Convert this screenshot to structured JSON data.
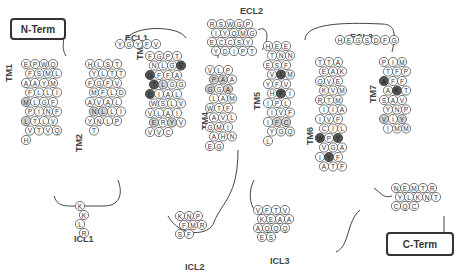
{
  "diagram": {
    "type": "GPCR snake plot",
    "terminals": {
      "n_term": "N-Term",
      "c_term": "C-Term"
    },
    "loops": {
      "ecl1": "ECL1",
      "ecl2": "ECL2",
      "ecl3": "ECL3",
      "icl1": "ICL1",
      "icl2": "ICL2",
      "icl3": "ICL3"
    },
    "helices": {
      "tm1": "TM1",
      "tm2": "TM2",
      "tm3": "TM3",
      "tm4": "TM4",
      "tm5": "TM5",
      "tm6": "TM6",
      "tm7": "TM7"
    },
    "colors": {
      "highlight_dark": "#555555",
      "shaded": "#cfcfcf",
      "outline": "#555555"
    },
    "segments": {
      "tm1": [
        "E",
        "P",
        "W",
        "Q",
        "F",
        "S",
        "M",
        "L",
        "A",
        "A",
        "Y",
        "M",
        "F",
        "L",
        "L",
        "I",
        "M",
        "L",
        "G",
        "F",
        "P",
        "I",
        "N",
        "F",
        "L",
        "T",
        "L",
        "V",
        "V",
        "T",
        "V",
        "Q",
        "H"
      ],
      "icl1": [
        "K",
        "K",
        "L",
        "R"
      ],
      "tm2": [
        "H",
        "L",
        "S",
        "T",
        "Y",
        "L",
        "T",
        "T",
        "F",
        "G",
        "F",
        "V",
        "M",
        "F",
        "L",
        "D",
        "A",
        "V",
        "A",
        "L",
        "N",
        "L",
        "L",
        "I",
        "Y",
        "N",
        "L",
        "P",
        "T"
      ],
      "ecl1": [
        "Y",
        "G",
        "Y",
        "F",
        "V"
      ],
      "tm3": [
        "F",
        "G",
        "P",
        "T",
        "N",
        "L",
        "G",
        "E",
        "G",
        "F",
        "F",
        "A",
        "T",
        "L",
        "G",
        "G",
        "E",
        "I",
        "A",
        "L",
        "W",
        "S",
        "L",
        "V",
        "V",
        "L",
        "A",
        "I",
        "E",
        "R",
        "Y",
        "V",
        "V",
        "V",
        "C"
      ],
      "icl2": [
        "K",
        "N",
        "P",
        "F",
        "M",
        "R",
        "S",
        "F"
      ],
      "tm4": [
        "V",
        "L",
        "P",
        "P",
        "A",
        "A",
        "G",
        "G",
        "A",
        "L",
        "A",
        "M",
        "W",
        "T",
        "F",
        "A",
        "V",
        "L",
        "G",
        "M",
        "I",
        "A",
        "H",
        "N",
        "E",
        "G"
      ],
      "ecl2": [
        "R",
        "S",
        "W",
        "G",
        "P",
        "I",
        "Y",
        "Q",
        "M",
        "G",
        "E",
        "C",
        "C",
        "S",
        "Y",
        "Y",
        "D",
        "I",
        "P",
        "T"
      ],
      "tm5": [
        "H",
        "E",
        "E",
        "T",
        "N",
        "N",
        "E",
        "S",
        "F",
        "V",
        "I",
        "M",
        "Y",
        "F",
        "V",
        "H",
        "F",
        "I",
        "I",
        "P",
        "L",
        "I",
        "V",
        "F",
        "I",
        "F",
        "C",
        "Y",
        "G",
        "Q",
        "L"
      ],
      "icl3": [
        "V",
        "F",
        "T",
        "V",
        "K",
        "E",
        "A",
        "A",
        "A",
        "Q",
        "Q",
        "Q",
        "E",
        "S"
      ],
      "tm6": [
        "T",
        "T",
        "A",
        "E",
        "A",
        "K",
        "Q",
        "V",
        "E",
        "K",
        "V",
        "M",
        "R",
        "T",
        "M",
        "I",
        "I",
        "A",
        "I",
        "V",
        "F",
        "C",
        "I",
        "L",
        "W",
        "P",
        "Y",
        "V",
        "G",
        "A",
        "I",
        "Y",
        "F",
        "A",
        "T",
        "F"
      ],
      "ecl3": [
        "H",
        "E",
        "G",
        "S",
        "D",
        "F",
        "G"
      ],
      "tm7": [
        "P",
        "I",
        "M",
        "T",
        "F",
        "P",
        "A",
        "F",
        "F",
        "A",
        "K",
        "T",
        "S",
        "A",
        "V",
        "Y",
        "N",
        "P",
        "V",
        "I",
        "Y",
        "I",
        "M",
        "M"
      ],
      "c_tail": [
        "N",
        "E",
        "M",
        "T",
        "R",
        "Y",
        "L",
        "K",
        "N",
        "T",
        "C",
        "Q",
        "C"
      ]
    }
  }
}
